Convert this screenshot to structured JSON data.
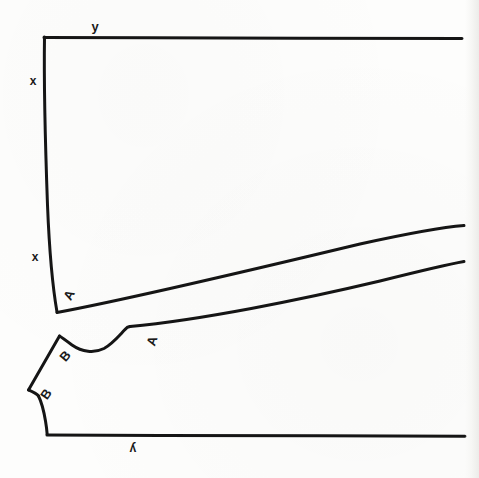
{
  "figure": {
    "type": "line-drawing",
    "background_color": "#fdfdfc",
    "ink_color": "#151515",
    "canvas": {
      "width": 479,
      "height": 478
    }
  },
  "labels": [
    {
      "id": "y-top",
      "text": "y",
      "x": 95,
      "y": 26,
      "rotation": 0,
      "size": 13
    },
    {
      "id": "x-upper",
      "text": "x",
      "x": 33,
      "y": 81,
      "rotation": 0,
      "size": 12
    },
    {
      "id": "x-lower",
      "text": "x",
      "x": 35,
      "y": 257,
      "rotation": 0,
      "size": 12
    },
    {
      "id": "a-upper",
      "text": "A",
      "x": 69,
      "y": 295,
      "rotation": -62,
      "size": 13
    },
    {
      "id": "a-lower",
      "text": "A",
      "x": 152,
      "y": 341,
      "rotation": -72,
      "size": 13
    },
    {
      "id": "b-upper",
      "text": "B",
      "x": 65,
      "y": 356,
      "rotation": -50,
      "size": 13
    },
    {
      "id": "b-lower",
      "text": "B",
      "x": 46,
      "y": 394,
      "rotation": -55,
      "size": 13
    },
    {
      "id": "y-bottom",
      "text": "y",
      "x": 133,
      "y": 449,
      "rotation": 180,
      "size": 12
    }
  ],
  "paths": {
    "upper_top_edge": {
      "name": "upper-top-edge",
      "d": "M 44 37.5 L 150 37.8 L 300 38.2 L 462 38.6",
      "width": 3.0
    },
    "upper_left_edge": {
      "name": "upper-left-edge",
      "d": "M 44.5 37 C 44.0 70, 45.5 150, 47.5 205 C 49.5 255, 53.5 292, 57 312",
      "width": 3.0
    },
    "upper_diag_edge": {
      "name": "upper-diagonal-edge",
      "d": "M 57 312.5 C 130 299, 260 268, 360 244 C 410 233, 445 227, 464 225.5",
      "width": 3.0
    },
    "lower_top_edge": {
      "name": "lower-top-edge",
      "d": "M 130 326.5 C 200 320, 300 300, 380 281 C 420 271, 450 264, 464 261.5",
      "width": 3.0
    },
    "lower_neck_curve": {
      "name": "lower-neckline-curve",
      "d": "M 130 326.5 L 127.5 327.2 C 122 332, 114 343, 104 348.5 C 94 353.5, 82 352, 72 345 C 66 340.5, 62 337.5, 59.5 336",
      "width": 3.0
    },
    "lower_shoulder_upper": {
      "name": "lower-shoulder-upper-edge",
      "d": "M 59.5 336 L 28.5 390",
      "width": 3.0
    },
    "lower_shoulder_notch": {
      "name": "lower-shoulder-notch",
      "d": "M 28.5 390 C 33 392, 36.5 393.5, 38.5 396",
      "width": 3.0
    },
    "lower_side_curve": {
      "name": "lower-side-curve",
      "d": "M 38.5 396 C 41.5 402, 44 412, 45.5 421 C 46.7 428, 47 432, 47.2 434.5",
      "width": 3.0
    },
    "lower_bottom_edge": {
      "name": "lower-bottom-edge",
      "d": "M 47 435 L 160 435.4 L 320 435.8 L 465 436.2",
      "width": 3.0
    }
  }
}
